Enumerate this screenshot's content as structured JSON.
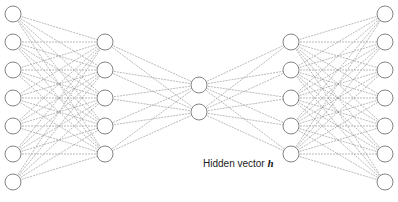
{
  "diagram": {
    "type": "autoencoder",
    "label_text": "Hidden vector ",
    "label_symbol": "h",
    "node_radius": 8,
    "line_color": "#8a8a8a",
    "node_stroke": "#777777",
    "layers": [
      {
        "name": "input",
        "x": 13,
        "ys": [
          14,
          42,
          70,
          98,
          126,
          154,
          182
        ]
      },
      {
        "name": "encoder-hidden",
        "x": 105,
        "ys": [
          42,
          70,
          98,
          126,
          154
        ]
      },
      {
        "name": "code",
        "x": 199,
        "ys": [
          85,
          112
        ]
      },
      {
        "name": "decoder-hidden",
        "x": 291,
        "ys": [
          42,
          70,
          98,
          126,
          154
        ]
      },
      {
        "name": "output",
        "x": 385,
        "ys": [
          14,
          42,
          70,
          98,
          126,
          154,
          182
        ]
      }
    ]
  }
}
